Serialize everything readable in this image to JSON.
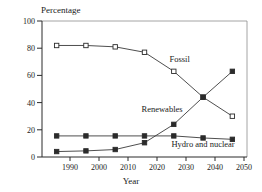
{
  "chart_data": {
    "type": "line",
    "title": "",
    "xlabel": "Year",
    "ylabel": "Percentage",
    "categories": [
      "1990",
      "2000",
      "2010",
      "2020",
      "2030",
      "2040",
      "2050"
    ],
    "x": [
      1990,
      2000,
      2010,
      2020,
      2030,
      2040,
      2050
    ],
    "xlim": [
      1985,
      2055
    ],
    "ylim": [
      0,
      100
    ],
    "yticks": [
      "0",
      "20",
      "40",
      "60",
      "80",
      "100"
    ],
    "ytick_values": [
      0,
      20,
      40,
      60,
      80,
      100
    ],
    "grid": false,
    "legend_position": "inline-annotations",
    "series": [
      {
        "name": "Fossil",
        "marker": "open-square",
        "color": "#2b2b2b",
        "label_x": 2032,
        "label_y": 70,
        "values": [
          82,
          82,
          81,
          77,
          63,
          44,
          30
        ]
      },
      {
        "name": "Renewables",
        "marker": "filled-square",
        "color": "#2b2b2b",
        "label_x": 2026,
        "label_y": 33,
        "values": [
          4,
          4.5,
          5.5,
          10.5,
          24,
          44,
          63
        ]
      },
      {
        "name": "Hydro and nuclear",
        "marker": "filled-square",
        "color": "#2b2b2b",
        "label_x": 2040,
        "label_y": 7.5,
        "values": [
          15.5,
          15.5,
          15.5,
          15.5,
          15.5,
          14,
          13
        ]
      }
    ]
  }
}
